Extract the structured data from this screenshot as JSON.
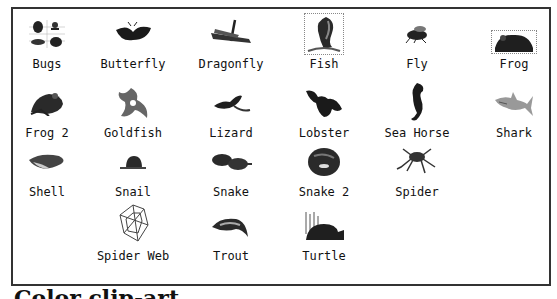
{
  "library": {
    "items": [
      {
        "label": "Bugs",
        "icon": "bugs-icon",
        "col": 0,
        "row": 0,
        "selected": false
      },
      {
        "label": "Butterfly",
        "icon": "butterfly-icon",
        "col": 1,
        "row": 0,
        "selected": false
      },
      {
        "label": "Dragonfly",
        "icon": "dragonfly-icon",
        "col": 2,
        "row": 0,
        "selected": false
      },
      {
        "label": "Fish",
        "icon": "fish-icon",
        "col": 3,
        "row": 0,
        "selected": true
      },
      {
        "label": "Fly",
        "icon": "fly-icon",
        "col": 4,
        "row": 0,
        "selected": false
      },
      {
        "label": "Frog",
        "icon": "frog-icon",
        "col": 5,
        "row": 0,
        "selected": false
      },
      {
        "label": "Frog 2",
        "icon": "frog-icon",
        "col": 0,
        "row": 1,
        "selected": false
      },
      {
        "label": "Goldfish",
        "icon": "goldfish-icon",
        "col": 1,
        "row": 1,
        "selected": false
      },
      {
        "label": "Lizard",
        "icon": "lizard-icon",
        "col": 2,
        "row": 1,
        "selected": false
      },
      {
        "label": "Lobster",
        "icon": "lobster-icon",
        "col": 3,
        "row": 1,
        "selected": false
      },
      {
        "label": "Sea Horse",
        "icon": "sea-horse-icon",
        "col": 4,
        "row": 1,
        "selected": false
      },
      {
        "label": "Shark",
        "icon": "shark-icon",
        "col": 5,
        "row": 1,
        "selected": false
      },
      {
        "label": "Shell",
        "icon": "shell-icon",
        "col": 0,
        "row": 2,
        "selected": false
      },
      {
        "label": "Snail",
        "icon": "snail-icon",
        "col": 1,
        "row": 2,
        "selected": false
      },
      {
        "label": "Snake",
        "icon": "snake-icon",
        "col": 2,
        "row": 2,
        "selected": false
      },
      {
        "label": "Snake 2",
        "icon": "snake-icon",
        "col": 3,
        "row": 2,
        "selected": false
      },
      {
        "label": "Spider",
        "icon": "spider-icon",
        "col": 4,
        "row": 2,
        "selected": false
      },
      {
        "label": "Spider Web",
        "icon": "spider-web-icon",
        "col": 1,
        "row": 3,
        "selected": false
      },
      {
        "label": "Trout",
        "icon": "trout-icon",
        "col": 2,
        "row": 3,
        "selected": false
      },
      {
        "label": "Turtle",
        "icon": "turtle-icon",
        "col": 3,
        "row": 3,
        "selected": false
      }
    ]
  },
  "caption": "Color clip-art"
}
